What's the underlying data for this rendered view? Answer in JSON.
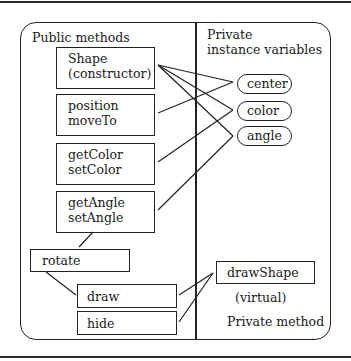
{
  "diagram": {
    "public_section": {
      "heading": "Public methods",
      "boxes": [
        {
          "id": "shape",
          "text": "Shape\n(constructor)"
        },
        {
          "id": "position",
          "text": "position\nmoveTo"
        },
        {
          "id": "color",
          "text": "getColor\nsetColor"
        },
        {
          "id": "angle",
          "text": "getAngle\nsetAngle"
        },
        {
          "id": "rotate",
          "text": "rotate"
        },
        {
          "id": "draw",
          "text": "draw"
        },
        {
          "id": "hide",
          "text": "hide"
        }
      ]
    },
    "private_section": {
      "heading_line1": "Private",
      "heading_line2": "instance variables",
      "variables": [
        {
          "id": "center",
          "text": "center"
        },
        {
          "id": "color",
          "text": "color"
        },
        {
          "id": "angle",
          "text": "angle"
        }
      ],
      "method_box": "drawShape",
      "method_note": "(virtual)",
      "method_caption": "Private method"
    },
    "connections": [
      {
        "from": "Shape (constructor)",
        "to": "center"
      },
      {
        "from": "Shape (constructor)",
        "to": "color"
      },
      {
        "from": "Shape (constructor)",
        "to": "angle"
      },
      {
        "from": "position moveTo",
        "to": "center"
      },
      {
        "from": "getColor setColor",
        "to": "color"
      },
      {
        "from": "getAngle setAngle",
        "to": "angle"
      },
      {
        "from": "getAngle setAngle",
        "to": "rotate"
      },
      {
        "from": "rotate",
        "to": "draw"
      },
      {
        "from": "draw",
        "to": "drawShape"
      },
      {
        "from": "hide",
        "to": "drawShape"
      }
    ]
  }
}
